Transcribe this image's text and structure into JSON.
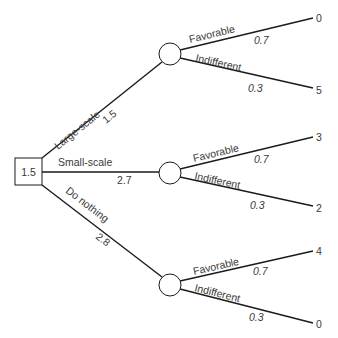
{
  "decision_node": {
    "value": "1.5"
  },
  "alternatives": [
    {
      "label": "Large-scale",
      "expected_value": "1.5",
      "outcomes": [
        {
          "label": "Favorable",
          "probability": "0.7",
          "payoff": "0"
        },
        {
          "label": "Indifferent",
          "probability": "0.3",
          "payoff": "5"
        }
      ]
    },
    {
      "label": "Small-scale",
      "expected_value": "2.7",
      "outcomes": [
        {
          "label": "Favorable",
          "probability": "0.7",
          "payoff": "3"
        },
        {
          "label": "Indifferent",
          "probability": "0.3",
          "payoff": "2"
        }
      ]
    },
    {
      "label": "Do nothing",
      "expected_value": "2.8",
      "outcomes": [
        {
          "label": "Favorable",
          "probability": "0.7",
          "payoff": "4"
        },
        {
          "label": "Indifferent",
          "probability": "0.3",
          "payoff": "0"
        }
      ]
    }
  ],
  "colors": {
    "line": "#1a1a1a",
    "text": "#3a3a3a",
    "background": "#ffffff"
  }
}
